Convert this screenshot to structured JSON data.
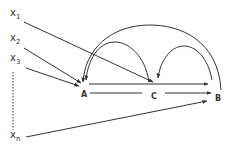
{
  "diagram": {
    "inputs": [
      {
        "label": "x",
        "sub": "1",
        "target": "C"
      },
      {
        "label": "x",
        "sub": "2",
        "target": "A"
      },
      {
        "label": "x",
        "sub": "3",
        "target": "A"
      },
      {
        "label": "x",
        "sub": "n",
        "target": "B"
      }
    ],
    "nodes": [
      {
        "id": "A",
        "label": "A"
      },
      {
        "id": "C",
        "label": "C"
      },
      {
        "id": "B",
        "label": "B"
      }
    ],
    "edges": [
      {
        "from": "A",
        "to": "B",
        "type": "straight"
      },
      {
        "from": "A",
        "to": "C",
        "type": "straight"
      },
      {
        "from": "C",
        "to": "B",
        "type": "straight"
      },
      {
        "from": "B",
        "to": "A",
        "type": "feedback-arc"
      },
      {
        "from": "C",
        "to": "A",
        "type": "feedback-arc"
      },
      {
        "from": "B",
        "to": "C",
        "type": "feedback-arc"
      },
      {
        "from": "x1",
        "to": "C",
        "type": "input"
      },
      {
        "from": "x2",
        "to": "A",
        "type": "input"
      },
      {
        "from": "x3",
        "to": "A",
        "type": "input"
      },
      {
        "from": "xn",
        "to": "B",
        "type": "input"
      }
    ],
    "ellipsis": "dotted line between x3 and xn",
    "stroke_color": "#333333"
  }
}
